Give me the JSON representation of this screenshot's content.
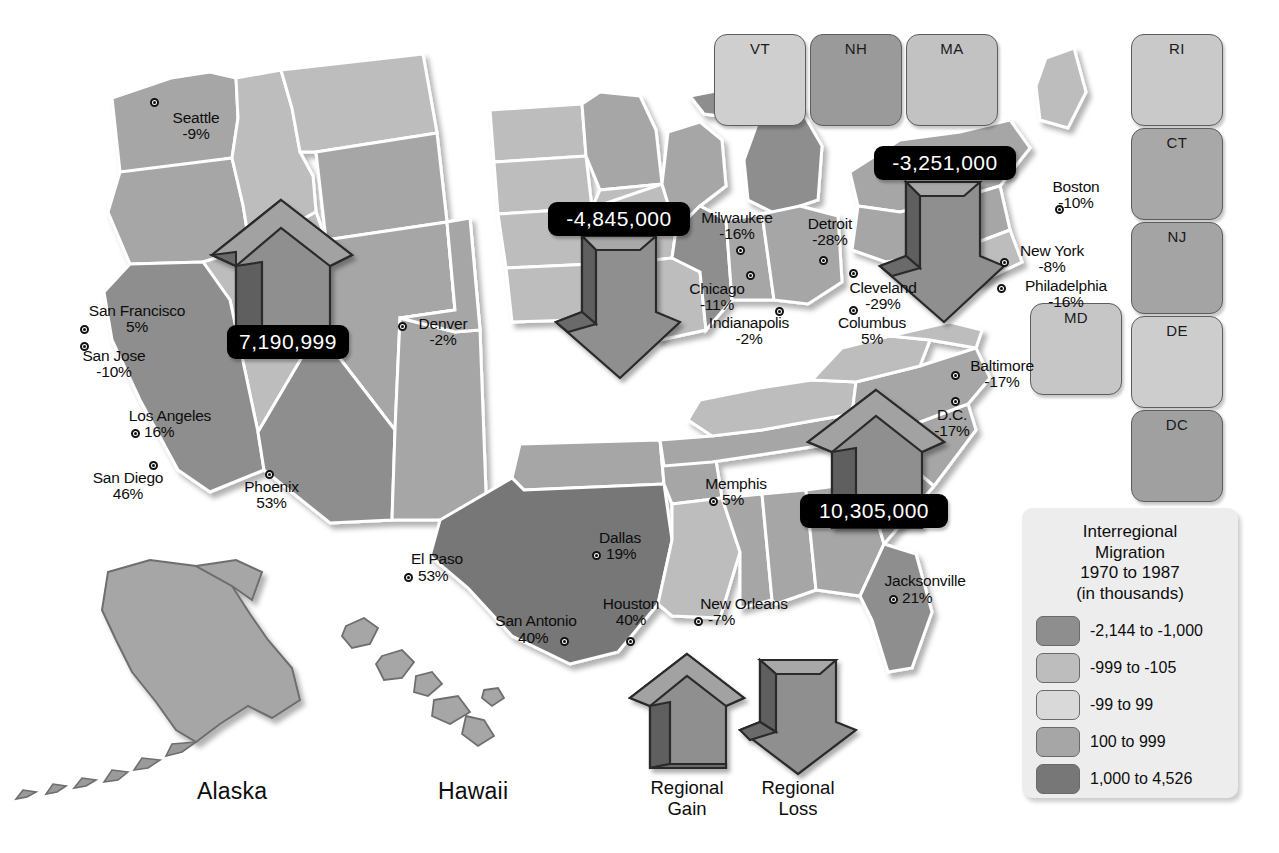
{
  "legend": {
    "title_lines": [
      "Interregional",
      "Migration",
      "1970 to 1987",
      "(in thousands)"
    ],
    "entries": [
      {
        "label": "-2,144 to -1,000",
        "color": "#8e8e8e"
      },
      {
        "label": "-999 to -105",
        "color": "#bdbdbd"
      },
      {
        "label": "-99 to 99",
        "color": "#d9d9d9"
      },
      {
        "label": "100 to 999",
        "color": "#a6a6a6"
      },
      {
        "label": "1,000 to 4,526",
        "color": "#777777"
      }
    ]
  },
  "arrow_key": [
    {
      "name": "regional-gain",
      "direction": "up",
      "lines": [
        "Regional",
        "Gain"
      ]
    },
    {
      "name": "regional-loss",
      "direction": "down",
      "lines": [
        "Regional",
        "Loss"
      ]
    }
  ],
  "region_flows": [
    {
      "name": "west",
      "value": "7,190,999",
      "direction": "up"
    },
    {
      "name": "midwest",
      "value": "-4,845,000",
      "direction": "down"
    },
    {
      "name": "northeast",
      "value": "-3,251,000",
      "direction": "down"
    },
    {
      "name": "south",
      "value": "10,305,000",
      "direction": "up"
    }
  ],
  "inset_states": [
    {
      "code": "VT",
      "color": "#cfcfcf"
    },
    {
      "code": "NH",
      "color": "#9a9a9a"
    },
    {
      "code": "MA",
      "color": "#c2c2c2"
    },
    {
      "code": "RI",
      "color": "#c9c9c9"
    },
    {
      "code": "CT",
      "color": "#a8a8a8"
    },
    {
      "code": "NJ",
      "color": "#a4a4a4"
    },
    {
      "code": "MD",
      "color": "#c6c6c6"
    },
    {
      "code": "DE",
      "color": "#cdcdcd"
    },
    {
      "code": "DC",
      "color": "#a0a0a0"
    }
  ],
  "region_names": [
    {
      "name": "Alaska"
    },
    {
      "name": "Hawaii"
    }
  ],
  "cities": [
    {
      "name": "Seattle",
      "pct": "-9%"
    },
    {
      "name": "San Francisco",
      "pct": "5%"
    },
    {
      "name": "San Jose",
      "pct": "-10%"
    },
    {
      "name": "Los Angeles",
      "pct": "16%"
    },
    {
      "name": "San Diego",
      "pct": "46%"
    },
    {
      "name": "Phoenix",
      "pct": "53%"
    },
    {
      "name": "Denver",
      "pct": "-2%"
    },
    {
      "name": "El Paso",
      "pct": "53%"
    },
    {
      "name": "Dallas",
      "pct": "19%"
    },
    {
      "name": "San Antonio",
      "pct": "40%"
    },
    {
      "name": "Houston",
      "pct": "40%"
    },
    {
      "name": "New Orleans",
      "pct": "-7%"
    },
    {
      "name": "Memphis",
      "pct": "5%"
    },
    {
      "name": "Milwaukee",
      "pct": "-16%"
    },
    {
      "name": "Chicago",
      "pct": "-11%"
    },
    {
      "name": "Indianapolis",
      "pct": "-2%"
    },
    {
      "name": "Detroit",
      "pct": "-28%"
    },
    {
      "name": "Cleveland",
      "pct": "-29%"
    },
    {
      "name": "Columbus",
      "pct": "5%"
    },
    {
      "name": "Jacksonville",
      "pct": "21%"
    },
    {
      "name": "Boston",
      "pct": "-10%"
    },
    {
      "name": "New York",
      "pct": "-8%"
    },
    {
      "name": "Philadelphia",
      "pct": "-16%"
    },
    {
      "name": "Baltimore",
      "pct": "-17%"
    },
    {
      "name": "D.C.",
      "pct": "-17%"
    }
  ],
  "colors": {
    "loss_large": "#8e8e8e",
    "loss_small": "#bdbdbd",
    "neutral": "#d9d9d9",
    "gain_small": "#a6a6a6",
    "gain_large": "#777777",
    "arrow_face": "#8f8f8f",
    "arrow_top": "#6f6f6f",
    "arrow_side": "#5a5a5a",
    "plaque_bg": "#000000",
    "border": "#ffffff"
  }
}
